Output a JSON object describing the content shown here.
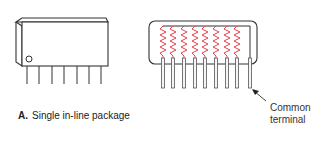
{
  "figure": {
    "panel_label": "A.",
    "caption": "Single in-line package",
    "callout": {
      "line1": "Common",
      "line2": "terminal"
    },
    "left_package": {
      "pins": 7,
      "marker": "pin-1 circle"
    },
    "right_package": {
      "resistors": 8,
      "pins": 9,
      "resistor_color": "#e0454f"
    }
  }
}
